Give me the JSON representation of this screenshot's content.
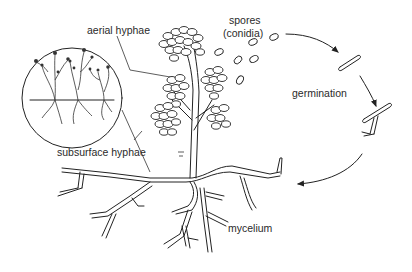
{
  "diagram": {
    "labels": {
      "aerial_hyphae": "aerial hyphae",
      "spores": "spores",
      "conidia": "(conidia)",
      "germination": "germination",
      "subsurface_hyphae": "subsurface hyphae",
      "mycelium": "mycelium"
    },
    "colors": {
      "line": "#222222",
      "background": "#ffffff",
      "text": "#2a2a2a"
    }
  }
}
